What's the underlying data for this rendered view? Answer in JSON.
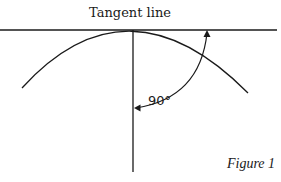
{
  "diagram": {
    "title": "Tangent line",
    "angle_label": "90°",
    "caption": "Figure 1",
    "elements": [
      {
        "type": "line",
        "name": "tangent-line",
        "from": [
          0,
          30
        ],
        "to": [
          277,
          30
        ]
      },
      {
        "type": "line",
        "name": "radius-line",
        "from": [
          133,
          30
        ],
        "to": [
          133,
          172
        ]
      },
      {
        "type": "arc",
        "name": "circle-arc",
        "from": [
          22,
          88
        ],
        "peak": [
          130,
          30
        ],
        "to": [
          248,
          93
        ]
      },
      {
        "type": "curved-arrow",
        "name": "right-angle-arrow",
        "from": [
          135,
          108
        ],
        "to": [
          207,
          31
        ],
        "double_headed": true
      }
    ],
    "stroke_color": "#1a1a1a",
    "background": "#ffffff"
  }
}
